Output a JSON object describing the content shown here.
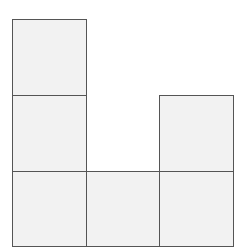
{
  "diagram": {
    "grid": {
      "origin_x": 12,
      "origin_y": 19,
      "cell_w": 73.5,
      "cell_h": 75.8
    },
    "fill_color": "#f2f2f2",
    "stroke_color": "#555555",
    "cells": [
      {
        "col": 0,
        "row": 0
      },
      {
        "col": 0,
        "row": 1
      },
      {
        "col": 0,
        "row": 2
      },
      {
        "col": 1,
        "row": 2
      },
      {
        "col": 2,
        "row": 1
      },
      {
        "col": 2,
        "row": 2
      }
    ]
  }
}
